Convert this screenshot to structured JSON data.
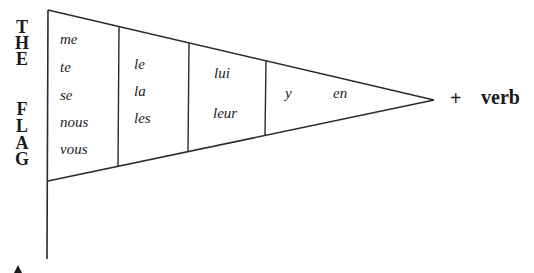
{
  "side_label": {
    "letters": [
      "T",
      "H",
      "E",
      "F",
      "L",
      "A",
      "G"
    ],
    "text": "THE FLAG"
  },
  "flag": {
    "sections": [
      {
        "name": "section-1",
        "words": [
          "me",
          "te",
          "se",
          "nous",
          "vous"
        ]
      },
      {
        "name": "section-2",
        "words": [
          "le",
          "la",
          "les"
        ]
      },
      {
        "name": "section-3",
        "words": [
          "lui",
          "leur"
        ]
      },
      {
        "name": "section-4",
        "words": [
          "y",
          "en"
        ]
      }
    ]
  },
  "suffix": {
    "plus": "+",
    "verb": "verb"
  },
  "colors": {
    "line": "#2a2a2a",
    "text": "#1a1a1a",
    "background": "#ffffff"
  }
}
